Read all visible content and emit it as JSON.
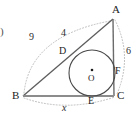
{
  "figure": {
    "enumeration_mark": ")",
    "vertices": [
      {
        "name": "A",
        "label": "A",
        "x": 113,
        "y": 18
      },
      {
        "name": "B",
        "label": "B",
        "x": 22,
        "y": 96
      },
      {
        "name": "C",
        "label": "C",
        "x": 114,
        "y": 96
      }
    ],
    "tangent_points": [
      {
        "name": "D",
        "label": "D",
        "x": 70,
        "y": 55,
        "on_side": "AB"
      },
      {
        "name": "E",
        "label": "E",
        "x": 92,
        "y": 96,
        "on_side": "BC"
      },
      {
        "name": "F",
        "label": "F",
        "x": 114,
        "y": 73,
        "on_side": "AC"
      }
    ],
    "incircle": {
      "center_label": "O",
      "center_x": 92,
      "center_y": 73,
      "radius": 23
    },
    "measures": [
      {
        "name": "arc-BD",
        "label": "9",
        "x": 48,
        "y": 31
      },
      {
        "name": "segment-AD",
        "label": "4",
        "x": 78,
        "y": 27
      },
      {
        "name": "arc-AF",
        "label": "6",
        "x": 122,
        "y": 46
      },
      {
        "name": "arc-BC",
        "label": "x",
        "x": 66,
        "y": 102,
        "italic": true
      }
    ],
    "colors": {
      "stroke": "#3a3a3a",
      "triangle_side": "#6e6e6e",
      "base_side": "#8c8c8c",
      "dotted_arc": "#b9b9b9",
      "circle": "#4a4a4a",
      "text": "#1b1b1b",
      "background": "#ffffff"
    }
  }
}
